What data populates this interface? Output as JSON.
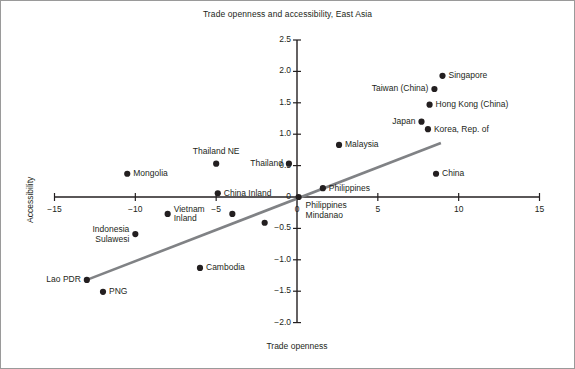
{
  "chart_data": {
    "type": "scatter",
    "title": "Trade openness and accessibility, East Asia",
    "xlabel": "Trade openness",
    "ylabel": "Accessibility",
    "xlim": [
      -15,
      15
    ],
    "ylim": [
      -2.0,
      2.5
    ],
    "xticks": [
      "−15",
      "−10",
      "−5",
      "0",
      "5",
      "10",
      "15"
    ],
    "xtick_values": [
      -15,
      -10,
      -5,
      0,
      5,
      10,
      15
    ],
    "yticks": [
      "2.5",
      "2.0",
      "1.5",
      "1.0",
      "0.5",
      "0",
      "−0.5",
      "−1.0",
      "−1.5",
      "−2.0"
    ],
    "ytick_values": [
      2.5,
      2.0,
      1.5,
      1.0,
      0.5,
      0,
      -0.5,
      -1.0,
      -1.5,
      -2.0
    ],
    "grid": false,
    "legend": "none",
    "points": [
      {
        "label": "Singapore",
        "x": 9.0,
        "y": 1.93,
        "pos": "right"
      },
      {
        "label": "Taiwan (China)",
        "x": 8.5,
        "y": 1.72,
        "pos": "left"
      },
      {
        "label": "Hong Kong (China)",
        "x": 8.2,
        "y": 1.47,
        "pos": "right"
      },
      {
        "label": "Japan",
        "x": 7.7,
        "y": 1.2,
        "pos": "left"
      },
      {
        "label": "Korea, Rep. of",
        "x": 8.1,
        "y": 1.08,
        "pos": "right"
      },
      {
        "label": "Malaysia",
        "x": 2.6,
        "y": 0.83,
        "pos": "right"
      },
      {
        "label": "China",
        "x": 8.6,
        "y": 0.37,
        "pos": "right"
      },
      {
        "label": "Thailand",
        "x": -0.5,
        "y": 0.53,
        "pos": "left"
      },
      {
        "label": "Thailand NE",
        "x": -5.0,
        "y": 0.53,
        "pos": "above"
      },
      {
        "label": "Mongolia",
        "x": -10.5,
        "y": 0.37,
        "pos": "right"
      },
      {
        "label": "China Inland",
        "x": -4.9,
        "y": 0.06,
        "pos": "right"
      },
      {
        "label": "Philippines",
        "x": 1.6,
        "y": 0.14,
        "pos": "right"
      },
      {
        "label": "Philippines\nMindanao",
        "x": 0.1,
        "y": 0.0,
        "pos": "below-right"
      },
      {
        "label": "Vietnam\nInland",
        "x": -8.0,
        "y": -0.27,
        "pos": "right"
      },
      {
        "label": "Indonesia\nSulawesi",
        "x": -10.0,
        "y": -0.59,
        "pos": "left"
      },
      {
        "label": "Cambodia",
        "x": -6.0,
        "y": -1.13,
        "pos": "right"
      },
      {
        "label": "Lao PDR",
        "x": -13.0,
        "y": -1.32,
        "pos": "left"
      },
      {
        "label": "PNG",
        "x": -12.0,
        "y": -1.51,
        "pos": "right"
      },
      {
        "label": "",
        "x": -4.0,
        "y": -0.27,
        "pos": "none"
      },
      {
        "label": "",
        "x": -2.0,
        "y": -0.41,
        "pos": "none"
      }
    ],
    "fit_line": {
      "x1": -13.0,
      "y1": -1.32,
      "x2": 8.9,
      "y2": 0.86
    }
  }
}
